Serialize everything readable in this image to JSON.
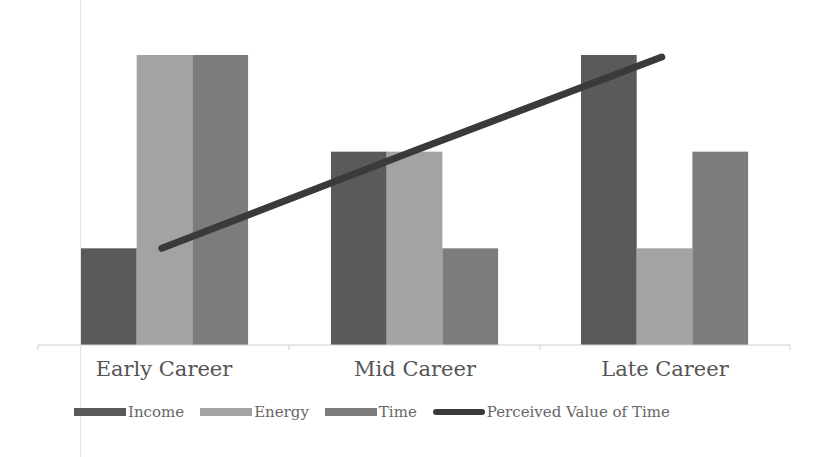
{
  "chart_data": {
    "type": "bar",
    "title": "",
    "xlabel": "",
    "ylabel": "",
    "categories": [
      "Early Career",
      "Mid Career",
      "Late Career"
    ],
    "series": [
      {
        "name": "Income",
        "type": "bar",
        "color": "#5a5a5a",
        "values": [
          1,
          2,
          3
        ]
      },
      {
        "name": "Energy",
        "type": "bar",
        "color": "#a3a3a3",
        "values": [
          3,
          2,
          1
        ]
      },
      {
        "name": "Time",
        "type": "bar",
        "color": "#7c7c7c",
        "values": [
          3,
          1,
          2
        ]
      },
      {
        "name": "Perceived Value of Time",
        "type": "line",
        "color": "#3a3a3a",
        "values": [
          1,
          2,
          3
        ]
      }
    ],
    "ylim": [
      0,
      3
    ],
    "grid": false,
    "y_axis_visible": false,
    "legend_position": "bottom"
  },
  "legend": {
    "items": [
      {
        "label": "Income",
        "color": "#5a5a5a",
        "kind": "bar"
      },
      {
        "label": "Energy",
        "color": "#a3a3a3",
        "kind": "bar"
      },
      {
        "label": "Time",
        "color": "#7c7c7c",
        "kind": "bar"
      },
      {
        "label": "Perceived Value of Time",
        "color": "#3a3a3a",
        "kind": "line"
      }
    ]
  },
  "axis": {
    "labels": [
      "Early Career",
      "Mid Career",
      "Late Career"
    ]
  }
}
